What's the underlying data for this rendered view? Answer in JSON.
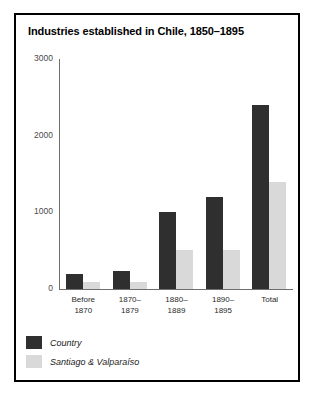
{
  "chart_data": {
    "type": "bar",
    "title": "Industries established in Chile, 1850–1895",
    "xlabel": "",
    "ylabel": "",
    "ylim": [
      0,
      3000
    ],
    "yticks": [
      0,
      1000,
      2000,
      3000
    ],
    "ytick_labels": [
      "0",
      "1000",
      "2000",
      "3000"
    ],
    "grid": false,
    "legend_position": "bottom-left",
    "categories": [
      "Before\n1870",
      "1870–\n1879",
      "1880–\n1889",
      "1890–\n1895",
      "Total"
    ],
    "category_lines": [
      [
        "Before",
        "1870"
      ],
      [
        "1870–",
        "1879"
      ],
      [
        "1880–",
        "1889"
      ],
      [
        "1890–",
        "1895"
      ],
      [
        "Total",
        ""
      ]
    ],
    "series": [
      {
        "name": "Country",
        "color": "#2f2f2f",
        "values": [
          200,
          230,
          1000,
          1200,
          2400
        ]
      },
      {
        "name": "Santiago & Valparaíso",
        "color": "#d9d9d9",
        "values": [
          95,
          95,
          510,
          510,
          1400
        ]
      }
    ]
  },
  "figure": {
    "border_color": "#000000",
    "background": "#ffffff",
    "axis_color": "#6f6f6f"
  }
}
